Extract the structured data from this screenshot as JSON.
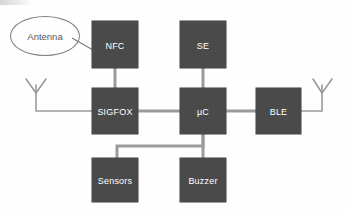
{
  "diagram": {
    "colors": {
      "node_fill": "#4a4a4a",
      "node_text": "#ffffff",
      "wire": "#9a9a9a",
      "outline": "#7d7d7d",
      "background": "#fefefe"
    },
    "nodes": [
      {
        "id": "nfc",
        "label": "NFC",
        "x": 92,
        "y": 21,
        "w": 46,
        "h": 47
      },
      {
        "id": "se",
        "label": "SE",
        "x": 180,
        "y": 21,
        "w": 46,
        "h": 47
      },
      {
        "id": "sigfox",
        "label": "SIGFOX",
        "x": 92,
        "y": 88,
        "w": 46,
        "h": 46
      },
      {
        "id": "mcu",
        "label": "µC",
        "x": 180,
        "y": 88,
        "w": 46,
        "h": 46
      },
      {
        "id": "ble",
        "label": "BLE",
        "x": 256,
        "y": 88,
        "w": 45,
        "h": 46
      },
      {
        "id": "sensors",
        "label": "Sensors",
        "x": 92,
        "y": 158,
        "w": 46,
        "h": 44
      },
      {
        "id": "buzzer",
        "label": "Buzzer",
        "x": 180,
        "y": 158,
        "w": 46,
        "h": 44
      }
    ],
    "bubbles": [
      {
        "id": "antenna-label",
        "label": "Antenna",
        "x": 10,
        "y": 16,
        "w": 68,
        "h": 38
      }
    ],
    "antennas": [
      {
        "id": "antenna-left",
        "side": "left"
      },
      {
        "id": "antenna-right",
        "side": "right"
      }
    ],
    "connections": [
      {
        "from": "nfc",
        "to": "sigfox"
      },
      {
        "from": "se",
        "to": "mcu"
      },
      {
        "from": "sigfox",
        "to": "mcu"
      },
      {
        "from": "mcu",
        "to": "ble"
      },
      {
        "from": "mcu",
        "to": "buzzer"
      },
      {
        "from": "mcu",
        "to": "sensors"
      },
      {
        "from": "antenna-left",
        "to": "sigfox"
      },
      {
        "from": "antenna-right",
        "to": "ble"
      },
      {
        "from": "antenna-label",
        "to": "nfc"
      }
    ]
  }
}
